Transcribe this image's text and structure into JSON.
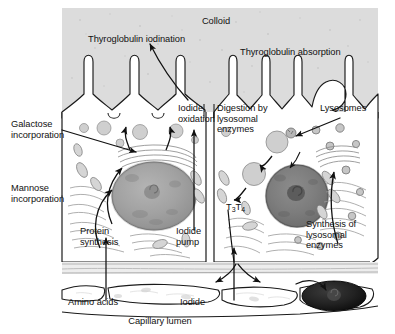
{
  "diagram": {
    "title_region": "Thyroid follicular cell — hormone synthesis and secretion",
    "colors": {
      "colloid_fill": "#dcdcdc",
      "cell_fill": "#ffffff",
      "left_nucleus": "#9d9d9d",
      "right_nucleus": "#7a7a7a",
      "endothelial_nucleus": "#1c1c1c",
      "outline": "#1a1a1a",
      "basement_membrane": "#c8c8c8",
      "vesicle_fill": "#cfcfcf"
    },
    "labels": {
      "colloid": "Colloid",
      "thyroglobulin_iodination": "Thyroglobulin iodination",
      "thyroglobulin_absorption": "Thyroglobulin absorption",
      "galactose_incorporation": "Galactose\nincorporation",
      "mannose_incorporation": "Mannose\nincorporation",
      "iodide_oxidation": "Iodide\noxidation",
      "digestion_by_lysosomal_enzymes": "Digestion by\nlysosomal\nenzymes",
      "lysosomes": "Lysosomes",
      "t3": "T",
      "t3_sub": "3",
      "t4": "T",
      "t4_sub": "4",
      "protein_synthesis": "Protein\nsynthesis",
      "iodide_pump": "Iodide\npump",
      "synthesis_of_lysosomal_enzymes": "Synthesis of\nlysosomal\nenzymes",
      "amino_acids": "Amino acids",
      "iodide": "Iodide",
      "capillary_lumen": "Capillary lumen"
    }
  }
}
